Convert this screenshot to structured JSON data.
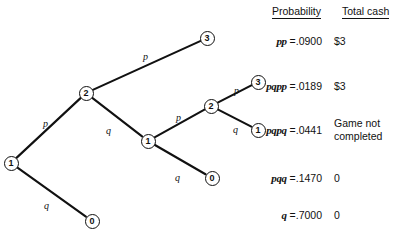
{
  "figure": {
    "type": "probability-tree-diagram",
    "background": "#ffffff",
    "ink_color": "#111111"
  },
  "table": {
    "headers": {
      "probability": "Probability",
      "total_cash": "Total cash"
    },
    "rows": [
      {
        "symbol": "pp",
        "equals": "=",
        "value": ".0900",
        "cash": "$3"
      },
      {
        "symbol": "pqpp",
        "equals": "=",
        "value": ".0189",
        "cash": "$3"
      },
      {
        "symbol": "pqpq",
        "equals": "=",
        "value": ".0441",
        "cash": "Game not\ncompleted"
      },
      {
        "symbol": "pqq",
        "equals": "=",
        "value": ".1470",
        "cash": "0"
      },
      {
        "symbol": "q",
        "equals": "=",
        "value": ".7000",
        "cash": "0"
      }
    ]
  },
  "tree": {
    "nodes": [
      {
        "id": "root",
        "label": "1",
        "x": 11,
        "y": 163
      },
      {
        "id": "n2a",
        "label": "2",
        "x": 86,
        "y": 93
      },
      {
        "id": "n3a",
        "label": "3",
        "x": 207,
        "y": 38
      },
      {
        "id": "n1b",
        "label": "1",
        "x": 148,
        "y": 141
      },
      {
        "id": "n2b",
        "label": "2",
        "x": 211,
        "y": 106
      },
      {
        "id": "n3b",
        "label": "3",
        "x": 258,
        "y": 82
      },
      {
        "id": "n1c",
        "label": "1",
        "x": 258,
        "y": 130
      },
      {
        "id": "n0b",
        "label": "0",
        "x": 212,
        "y": 178
      },
      {
        "id": "n0a",
        "label": "0",
        "x": 92,
        "y": 221
      }
    ],
    "edges": [
      {
        "from": "root",
        "to": "n2a",
        "label": "p",
        "lx": 43,
        "ly": 118
      },
      {
        "from": "root",
        "to": "n0a",
        "label": "q",
        "lx": 44,
        "ly": 200
      },
      {
        "from": "n2a",
        "to": "n3a",
        "label": "p",
        "lx": 143,
        "ly": 51
      },
      {
        "from": "n2a",
        "to": "n1b",
        "label": "q",
        "lx": 106,
        "ly": 125
      },
      {
        "from": "n1b",
        "to": "n2b",
        "label": "p",
        "lx": 176,
        "ly": 112
      },
      {
        "from": "n1b",
        "to": "n0b",
        "label": "q",
        "lx": 175,
        "ly": 172
      },
      {
        "from": "n2b",
        "to": "n3b",
        "label": "p",
        "lx": 234,
        "ly": 85
      },
      {
        "from": "n2b",
        "to": "n1c",
        "label": "q",
        "lx": 233,
        "ly": 124
      }
    ]
  }
}
